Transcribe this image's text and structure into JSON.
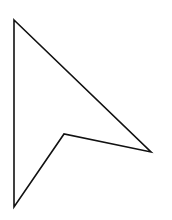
{
  "canvas": {
    "width": 172,
    "height": 220,
    "background": "#ffffff"
  },
  "icon": {
    "name": "arrow-cursor-icon",
    "stroke": "#111111",
    "fill": "#ffffff",
    "stroke_width": 1.6,
    "points": "14,20 151,152 64,134 14,207"
  }
}
